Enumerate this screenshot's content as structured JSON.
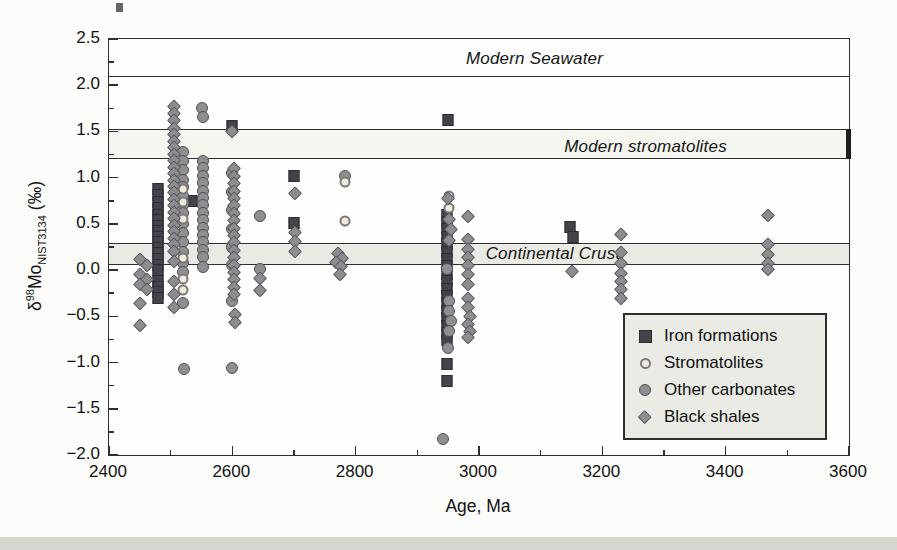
{
  "colors": {
    "page_bg": "#fcfcfa",
    "frame": "#2e2e2e",
    "footer_strip": "#d6d6d1",
    "legend_bg": "#ebebe6",
    "iron_formations": "#43434b",
    "iron_formations_border": "#2d2d33",
    "stromatolites_fill": "#f1ead6",
    "stromatolites_border": "#797980",
    "other_carbonates_fill": "#8f8f92",
    "other_carbonates_border": "#4f4f56",
    "black_shales_fill": "#8d8d90",
    "black_shales_border": "#595960",
    "band_stromatolites_fill": "#f5f5f0",
    "band_crust_fill": "#eaeae4"
  },
  "chart_data": {
    "type": "scatter",
    "xlabel": "Age, Ma",
    "ylabel_parts": {
      "delta": "δ",
      "isotope": "98",
      "element": "Mo",
      "standard": "NIST3134",
      "unit": "(‰)"
    },
    "xlim": [
      2400,
      3600
    ],
    "ylim": [
      -2.0,
      2.5
    ],
    "x_tick_values": [
      2400,
      2600,
      2800,
      3000,
      3200,
      3400,
      3600
    ],
    "x_tick_labels": [
      "2400",
      "2600",
      "2800",
      "3000",
      "3200",
      "3400",
      "3600"
    ],
    "x_minor_tick_values": [
      2500,
      2700,
      2900,
      3100,
      3300,
      3500
    ],
    "y_tick_values": [
      2.5,
      2.0,
      1.5,
      1.0,
      0.5,
      0.0,
      -0.5,
      -1.0,
      -1.5,
      -2.0
    ],
    "y_tick_labels": [
      "2.5",
      "2.0",
      "1.5",
      "1.0",
      "0.5",
      "0.0",
      "−0.5",
      "−1.0",
      "−1.5",
      "−2.0"
    ],
    "y_minor_tick_values": [
      2.25,
      1.75,
      1.25,
      0.75,
      0.25,
      -0.25,
      -0.75,
      -1.25,
      -1.75
    ],
    "grid": false,
    "legend_position": "lower-right",
    "annotations": [
      {
        "id": "modern-seawater",
        "label": "Modern Seawater",
        "type": "line",
        "value": 2.1,
        "label_x": 3090,
        "label_y": 2.28
      },
      {
        "id": "modern-stromatolites",
        "label": "Modern stromatolites",
        "type": "band",
        "from": 1.2,
        "to": 1.53,
        "fill": "#f5f5f0",
        "right_edge_bar": true,
        "label_x": 3270,
        "label_y": 1.33
      },
      {
        "id": "continental-crust",
        "label": "Continental Crust",
        "type": "band",
        "from": 0.06,
        "to": 0.29,
        "fill": "#eaeae4",
        "right_edge_bar": false,
        "label_x": 3120,
        "label_y": 0.17
      }
    ],
    "series": [
      {
        "id": "iron-formations",
        "label": "Iron formations",
        "marker": "square",
        "points": [
          [
            2480,
            0.88
          ],
          [
            2480,
            0.81
          ],
          [
            2480,
            0.74
          ],
          [
            2480,
            0.67
          ],
          [
            2480,
            0.6
          ],
          [
            2480,
            0.54
          ],
          [
            2480,
            0.48
          ],
          [
            2480,
            0.42
          ],
          [
            2480,
            0.36
          ],
          [
            2480,
            0.3
          ],
          [
            2480,
            0.24
          ],
          [
            2480,
            0.18
          ],
          [
            2480,
            0.12
          ],
          [
            2480,
            0.06
          ],
          [
            2480,
            0.0
          ],
          [
            2480,
            -0.12
          ],
          [
            2480,
            -0.18
          ],
          [
            2480,
            -0.24
          ],
          [
            2480,
            -0.3
          ],
          [
            2535,
            0.75
          ],
          [
            2600,
            1.56
          ],
          [
            2700,
            1.02
          ],
          [
            2700,
            0.51
          ],
          [
            2950,
            1.62
          ],
          [
            2948,
            0.6
          ],
          [
            2948,
            0.52
          ],
          [
            2948,
            0.44
          ],
          [
            2948,
            0.36
          ],
          [
            2948,
            0.28
          ],
          [
            2948,
            0.2
          ],
          [
            2948,
            0.12
          ],
          [
            2948,
            0.04
          ],
          [
            2948,
            -0.04
          ],
          [
            2948,
            -0.12
          ],
          [
            2948,
            -0.2
          ],
          [
            2948,
            -0.28
          ],
          [
            2948,
            -0.36
          ],
          [
            2948,
            -0.44
          ],
          [
            2948,
            -0.52
          ],
          [
            2948,
            -0.6
          ],
          [
            2948,
            -0.68
          ],
          [
            2948,
            -0.76
          ],
          [
            2948,
            -1.02
          ],
          [
            2948,
            -1.2
          ],
          [
            3148,
            0.47
          ],
          [
            3152,
            0.36
          ]
        ]
      },
      {
        "id": "stromatolites",
        "label": "Stromatolites",
        "marker": "circle-light",
        "points": [
          [
            2520,
            0.88
          ],
          [
            2520,
            0.74
          ],
          [
            2520,
            0.55
          ],
          [
            2520,
            0.13
          ],
          [
            2520,
            -0.1
          ],
          [
            2520,
            -0.21
          ],
          [
            2783,
            0.95
          ],
          [
            2783,
            0.53
          ],
          [
            2952,
            0.8
          ],
          [
            2952,
            0.67
          ]
        ]
      },
      {
        "id": "other-carbonates",
        "label": "Other carbonates",
        "marker": "circle",
        "points": [
          [
            2520,
            1.28
          ],
          [
            2520,
            1.18
          ],
          [
            2520,
            1.08
          ],
          [
            2520,
            0.98
          ],
          [
            2520,
            0.9
          ],
          [
            2520,
            0.8
          ],
          [
            2520,
            0.7
          ],
          [
            2520,
            0.62
          ],
          [
            2520,
            0.5
          ],
          [
            2520,
            0.4
          ],
          [
            2520,
            0.3
          ],
          [
            2520,
            0.2
          ],
          [
            2520,
            0.08
          ],
          [
            2520,
            -0.02
          ],
          [
            2520,
            -0.36
          ],
          [
            2522,
            -1.07
          ],
          [
            2550,
            1.75
          ],
          [
            2552,
            1.66
          ],
          [
            2552,
            1.18
          ],
          [
            2552,
            1.1
          ],
          [
            2552,
            1.02
          ],
          [
            2552,
            0.94
          ],
          [
            2552,
            0.86
          ],
          [
            2552,
            0.78
          ],
          [
            2552,
            0.7
          ],
          [
            2552,
            0.62
          ],
          [
            2552,
            0.54
          ],
          [
            2552,
            0.46
          ],
          [
            2552,
            0.38
          ],
          [
            2552,
            0.3
          ],
          [
            2552,
            0.22
          ],
          [
            2552,
            0.14
          ],
          [
            2552,
            0.03
          ],
          [
            2600,
            1.05
          ],
          [
            2600,
            0.85
          ],
          [
            2600,
            0.65
          ],
          [
            2600,
            0.45
          ],
          [
            2600,
            0.25
          ],
          [
            2600,
            0.05
          ],
          [
            2600,
            -0.33
          ],
          [
            2600,
            -1.06
          ],
          [
            2645,
            0.58
          ],
          [
            2645,
            0.01
          ],
          [
            2783,
            1.02
          ],
          [
            2948,
            0.01
          ],
          [
            2952,
            -0.33
          ],
          [
            2952,
            -0.44
          ],
          [
            2955,
            -0.55
          ],
          [
            2952,
            -0.66
          ],
          [
            2950,
            -0.84
          ],
          [
            2941,
            -1.83
          ]
        ]
      },
      {
        "id": "black-shales",
        "label": "Black shales",
        "marker": "diamond",
        "points": [
          [
            2450,
            0.12
          ],
          [
            2450,
            -0.04
          ],
          [
            2450,
            -0.15
          ],
          [
            2450,
            -0.36
          ],
          [
            2450,
            -0.59
          ],
          [
            2462,
            0.06
          ],
          [
            2462,
            -0.1
          ],
          [
            2462,
            -0.2
          ],
          [
            2505,
            1.78
          ],
          [
            2505,
            1.7
          ],
          [
            2505,
            1.62
          ],
          [
            2505,
            1.54
          ],
          [
            2505,
            1.47
          ],
          [
            2505,
            1.4
          ],
          [
            2505,
            1.33
          ],
          [
            2505,
            1.26
          ],
          [
            2505,
            1.19
          ],
          [
            2505,
            1.12
          ],
          [
            2505,
            1.05
          ],
          [
            2505,
            0.98
          ],
          [
            2505,
            0.91
          ],
          [
            2505,
            0.84
          ],
          [
            2505,
            0.77
          ],
          [
            2505,
            0.7
          ],
          [
            2505,
            0.63
          ],
          [
            2505,
            0.56
          ],
          [
            2505,
            0.49
          ],
          [
            2505,
            0.42
          ],
          [
            2505,
            0.35
          ],
          [
            2505,
            0.28
          ],
          [
            2505,
            0.21
          ],
          [
            2505,
            0.1
          ],
          [
            2505,
            -0.12
          ],
          [
            2505,
            -0.26
          ],
          [
            2505,
            -0.4
          ],
          [
            2600,
            1.5
          ],
          [
            2602,
            1.1
          ],
          [
            2602,
            1.02
          ],
          [
            2602,
            0.94
          ],
          [
            2602,
            0.86
          ],
          [
            2602,
            0.78
          ],
          [
            2602,
            0.7
          ],
          [
            2602,
            0.62
          ],
          [
            2602,
            0.54
          ],
          [
            2602,
            0.46
          ],
          [
            2602,
            0.38
          ],
          [
            2602,
            0.3
          ],
          [
            2602,
            0.22
          ],
          [
            2602,
            0.14
          ],
          [
            2602,
            0.06
          ],
          [
            2602,
            -0.02
          ],
          [
            2602,
            -0.1
          ],
          [
            2602,
            -0.18
          ],
          [
            2602,
            -0.26
          ],
          [
            2604,
            -0.47
          ],
          [
            2604,
            -0.56
          ],
          [
            2645,
            -0.09
          ],
          [
            2645,
            -0.22
          ],
          [
            2702,
            0.83
          ],
          [
            2702,
            0.41
          ],
          [
            2702,
            0.32
          ],
          [
            2702,
            0.21
          ],
          [
            2772,
            0.18
          ],
          [
            2778,
            0.13
          ],
          [
            2768,
            0.09
          ],
          [
            2776,
            0.04
          ],
          [
            2774,
            -0.04
          ],
          [
            2950,
            0.78
          ],
          [
            2952,
            0.55
          ],
          [
            2954,
            0.45
          ],
          [
            2952,
            0.33
          ],
          [
            2982,
            0.59
          ],
          [
            2982,
            0.34
          ],
          [
            2982,
            0.23
          ],
          [
            2982,
            0.14
          ],
          [
            2982,
            0.05
          ],
          [
            2982,
            -0.04
          ],
          [
            2982,
            -0.15
          ],
          [
            2982,
            -0.3
          ],
          [
            2982,
            -0.4
          ],
          [
            2985,
            -0.5
          ],
          [
            2982,
            -0.58
          ],
          [
            2985,
            -0.66
          ],
          [
            2982,
            -0.72
          ],
          [
            3150,
            -0.01
          ],
          [
            3230,
            0.39
          ],
          [
            3230,
            0.2
          ],
          [
            3230,
            0.08
          ],
          [
            3230,
            -0.03
          ],
          [
            3230,
            -0.12
          ],
          [
            3230,
            -0.2
          ],
          [
            3230,
            -0.3
          ],
          [
            3468,
            0.6
          ],
          [
            3468,
            0.28
          ],
          [
            3468,
            0.17
          ],
          [
            3468,
            0.08
          ],
          [
            3468,
            0.01
          ]
        ]
      }
    ]
  }
}
